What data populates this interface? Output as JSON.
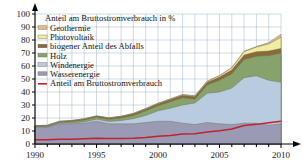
{
  "chart_data": {
    "type": "area",
    "title": "Anteil am Bruttostromverbrauch in %",
    "xlabel": "",
    "ylabel": "",
    "xlim": [
      1990,
      2010
    ],
    "ylim": [
      0,
      100
    ],
    "grid": true,
    "legend_position": "top-left",
    "y_ticks": [
      0,
      10,
      20,
      30,
      40,
      50,
      60,
      70,
      80,
      90,
      100
    ],
    "y_tick_labels": [
      "0",
      "10",
      "20",
      "30",
      "40",
      "50",
      "60",
      "70",
      "80",
      "90",
      "100"
    ],
    "x_ticks": [
      1990,
      1995,
      2000,
      2005,
      2010
    ],
    "x_tick_labels": [
      "1990",
      "1995",
      "2000",
      "2005",
      "2010"
    ],
    "x_minor_ticks": [
      1991,
      1992,
      1993,
      1994,
      1996,
      1997,
      1998,
      1999,
      2001,
      2002,
      2003,
      2004,
      2006,
      2007,
      2008,
      2009
    ],
    "x": [
      1990,
      1991,
      1992,
      1993,
      1994,
      1995,
      1996,
      1997,
      1998,
      1999,
      2000,
      2001,
      2002,
      2003,
      2004,
      2005,
      2006,
      2007,
      2008,
      2009,
      2010
    ],
    "series": [
      {
        "name": "Wasserenergie",
        "color": "#9a9ab4",
        "values": [
          13.0,
          12.8,
          15.5,
          15.5,
          16.0,
          17.5,
          15.5,
          15.5,
          15.5,
          16.5,
          17.5,
          17.5,
          16.0,
          15.0,
          16.5,
          15.5,
          15.0,
          16.0,
          16.0,
          14.5,
          15.5
        ]
      },
      {
        "name": "Windenergie",
        "color": "#b9ccdf",
        "values": [
          0.1,
          0.2,
          0.4,
          0.7,
          1.0,
          1.5,
          1.8,
          2.5,
          4.0,
          5.5,
          8.0,
          10.0,
          14.0,
          16.5,
          22.5,
          24.5,
          28.0,
          35.0,
          36.5,
          34.5,
          32.0
        ]
      },
      {
        "name": "Holz",
        "color": "#87a26b"
      },
      {
        "name": "biogener Anteil des Abfalls",
        "color": "#8a6a3a"
      },
      {
        "name": "Photovoltaik",
        "color": "#f2eda0"
      },
      {
        "name": "Geothermie",
        "color": "#e0bb8e"
      },
      {
        "name": "Anteil am Bruttostromverbrauch",
        "color": "#c0222a",
        "type": "line",
        "values": [
          3.2,
          3.3,
          3.6,
          3.7,
          4.0,
          4.5,
          4.3,
          4.3,
          4.5,
          5.0,
          6.0,
          6.6,
          7.6,
          7.8,
          9.3,
          10.2,
          11.6,
          14.2,
          15.1,
          16.3,
          17.5
        ]
      }
    ],
    "legend": [
      {
        "label": "Geothermie",
        "color": "#e0bb8e",
        "marker": "swatch"
      },
      {
        "label": "Photovoltaik",
        "color": "#f2eda0",
        "marker": "swatch"
      },
      {
        "label": "biogener Anteil des Abfalls",
        "color": "#8a6a3a",
        "marker": "swatch"
      },
      {
        "label": "Holz",
        "color": "#87a26b",
        "marker": "swatch"
      },
      {
        "label": "Windenergie",
        "color": "#b9ccdf",
        "marker": "swatch"
      },
      {
        "label": "Wasserenergie",
        "color": "#9a9ab4",
        "marker": "swatch"
      },
      {
        "label": "Anteil am Bruttostromverbrauch",
        "color": "#c0222a",
        "marker": "line"
      }
    ],
    "stack_totals": {
      "description": "cumulative stacked top boundary per band, in percent",
      "wasser": [
        13.0,
        12.8,
        15.5,
        15.5,
        16.0,
        17.5,
        15.5,
        15.5,
        15.5,
        16.5,
        17.5,
        17.5,
        16.0,
        15.0,
        16.5,
        15.5,
        15.0,
        16.0,
        16.0,
        14.5,
        15.5
      ],
      "wind": [
        13.1,
        13.0,
        15.9,
        16.2,
        17.0,
        19.0,
        17.3,
        18.0,
        19.5,
        22.0,
        25.5,
        27.5,
        30.0,
        31.5,
        39.0,
        40.0,
        43.0,
        51.0,
        52.5,
        49.0,
        47.5
      ],
      "holz": [
        13.6,
        13.8,
        16.8,
        17.3,
        18.5,
        20.5,
        19.0,
        20.0,
        22.0,
        25.5,
        29.5,
        32.5,
        35.5,
        34.5,
        45.5,
        49.0,
        54.0,
        65.0,
        67.5,
        68.0,
        70.0
      ],
      "abfall": [
        14.0,
        14.3,
        17.4,
        18.0,
        19.3,
        21.5,
        20.0,
        21.2,
        23.3,
        27.0,
        31.0,
        34.2,
        37.5,
        36.5,
        47.5,
        51.5,
        57.0,
        68.5,
        71.0,
        71.5,
        73.5
      ],
      "photovoltaik": [
        14.1,
        14.4,
        17.5,
        18.1,
        19.4,
        21.6,
        20.1,
        21.3,
        23.5,
        27.2,
        31.3,
        34.6,
        38.0,
        37.0,
        48.2,
        52.5,
        58.5,
        71.0,
        74.5,
        77.0,
        82.0
      ],
      "geothermie": [
        14.1,
        14.4,
        17.5,
        18.1,
        19.4,
        21.6,
        20.2,
        21.4,
        23.6,
        27.3,
        31.4,
        34.7,
        38.1,
        37.1,
        48.4,
        52.7,
        58.8,
        71.4,
        75.0,
        78.0,
        84.5
      ]
    }
  },
  "accessibility": {
    "chart_name": "renewable-energy-share-stacked-area-chart"
  }
}
